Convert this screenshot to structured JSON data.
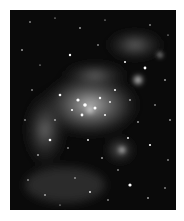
{
  "image": {
    "subject": "star cluster and nebula, grayscale astronomical photograph",
    "colors": {
      "background": "#0a0a0a",
      "nebula": "#8a8a8a",
      "stars": "#ffffff",
      "page": "#ffffff"
    }
  }
}
